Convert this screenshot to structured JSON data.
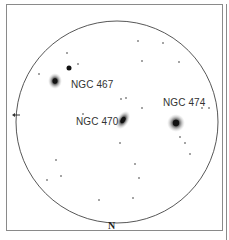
{
  "chart": {
    "title": "",
    "orientation_label": "N",
    "direction_arrow": "arrow-left",
    "field_circle": {
      "cx": 117,
      "cy": 122,
      "r": 101,
      "stroke": "#444444"
    },
    "objects": [
      {
        "name": "NGC 467",
        "type": "galaxy",
        "x": 55,
        "y": 81,
        "rx": 7,
        "ry": 8,
        "angle": 0,
        "label_x": 71,
        "label_y": 79
      },
      {
        "name": "NGC 470",
        "type": "galaxy",
        "x": 123,
        "y": 120,
        "rx": 6,
        "ry": 10,
        "angle": 30,
        "label_x": 76,
        "label_y": 116
      },
      {
        "name": "NGC 474",
        "type": "galaxy",
        "x": 176,
        "y": 123,
        "rx": 9,
        "ry": 9,
        "angle": 0,
        "label_x": 163,
        "label_y": 97
      }
    ],
    "bright_star": {
      "x": 69,
      "y": 68,
      "r": 2.5
    },
    "stars": [
      [
        138,
        41
      ],
      [
        163,
        43
      ],
      [
        67,
        53
      ],
      [
        142,
        61
      ],
      [
        179,
        62
      ],
      [
        78,
        64
      ],
      [
        39,
        74
      ],
      [
        121,
        99
      ],
      [
        126,
        98
      ],
      [
        142,
        108
      ],
      [
        202,
        108
      ],
      [
        209,
        108
      ],
      [
        83,
        114
      ],
      [
        180,
        137
      ],
      [
        185,
        143
      ],
      [
        190,
        154
      ],
      [
        120,
        143
      ],
      [
        56,
        160
      ],
      [
        61,
        176
      ],
      [
        47,
        180
      ],
      [
        135,
        164
      ],
      [
        139,
        178
      ],
      [
        99,
        200
      ],
      [
        133,
        198
      ]
    ],
    "colors": {
      "galaxy": "#222222",
      "star": "#333333",
      "frame": "#8a8a8a"
    }
  }
}
